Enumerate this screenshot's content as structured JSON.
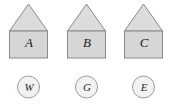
{
  "figure": {
    "type": "diagram",
    "background_color": "#ffffff",
    "house_body_fill": "#d6d6d6",
    "house_roof_fill": "#dcdcdc",
    "outline_color": "#8a8a8a",
    "token_fill": "#f2f2f2",
    "token_outline_color": "#9a9a9a",
    "text_color": "#1c1c1c"
  },
  "houses": [
    {
      "label": "A",
      "x": 0
    },
    {
      "label": "B",
      "x": 58
    },
    {
      "label": "C",
      "x": 115
    }
  ],
  "tokens": [
    {
      "label": "W",
      "x": 0
    },
    {
      "label": "G",
      "x": 58
    },
    {
      "label": "E",
      "x": 115
    }
  ]
}
